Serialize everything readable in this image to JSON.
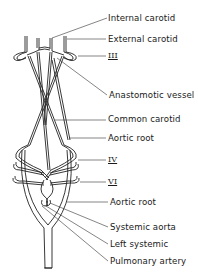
{
  "diagram": {
    "labels": [
      {
        "id": "internal-carotid",
        "text": "Internal carotid",
        "x": 108,
        "y": 13
      },
      {
        "id": "external-carotid",
        "text": "External carotid",
        "x": 108,
        "y": 34
      },
      {
        "id": "arch-iii",
        "text": "III",
        "x": 108,
        "y": 51
      },
      {
        "id": "anastomotic-vessel",
        "text": "Anastomotic vessel",
        "x": 109,
        "y": 90
      },
      {
        "id": "common-carotid",
        "text": "Common carotid",
        "x": 108,
        "y": 114
      },
      {
        "id": "aortic-root-upper",
        "text": "Aortic root",
        "x": 108,
        "y": 133
      },
      {
        "id": "arch-iv",
        "text": "IV",
        "x": 108,
        "y": 155
      },
      {
        "id": "arch-vi",
        "text": "VI",
        "x": 108,
        "y": 177
      },
      {
        "id": "aortic-root-lower",
        "text": "Aortic root",
        "x": 110,
        "y": 197
      },
      {
        "id": "systemic-aorta",
        "text": "Systemic aorta",
        "x": 110,
        "y": 222
      },
      {
        "id": "left-systemic",
        "text": "Left systemic",
        "x": 110,
        "y": 239
      },
      {
        "id": "pulmonary-artery",
        "text": "Pulmonary artery",
        "x": 110,
        "y": 256
      }
    ]
  }
}
